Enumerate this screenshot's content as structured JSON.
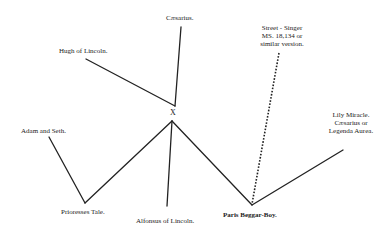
{
  "diagram": {
    "type": "stemma",
    "nodes": [
      {
        "id": "caesarius",
        "label": "Cæsarius."
      },
      {
        "id": "hugh",
        "label": "Hugh of Lincoln."
      },
      {
        "id": "x",
        "label": "X"
      },
      {
        "id": "adam",
        "label": "Adam and Seth."
      },
      {
        "id": "prioresses",
        "label": "Prioresses Tale."
      },
      {
        "id": "alfonsus",
        "label": "Alfonsus of Lincoln."
      },
      {
        "id": "street",
        "lines": [
          "Street - Singer",
          "MS. 18,134 or",
          "similar version."
        ]
      },
      {
        "id": "paris",
        "label": "Paris Beggar-Boy."
      },
      {
        "id": "lily",
        "lines": [
          "Lily Miracle.",
          "Cæsarius or",
          "Legenda Aurea."
        ]
      }
    ],
    "edges": [
      {
        "from": "caesarius",
        "to": "x",
        "style": "solid"
      },
      {
        "from": "hugh",
        "to": "x",
        "style": "solid"
      },
      {
        "from": "adam",
        "to": "prioresses",
        "style": "solid"
      },
      {
        "from": "prioresses",
        "to": "x",
        "style": "solid"
      },
      {
        "from": "alfonsus",
        "to": "x",
        "style": "solid"
      },
      {
        "from": "x",
        "to": "paris",
        "style": "solid"
      },
      {
        "from": "paris",
        "to": "lily",
        "style": "solid"
      },
      {
        "from": "street",
        "to": "paris",
        "style": "dotted"
      }
    ]
  }
}
